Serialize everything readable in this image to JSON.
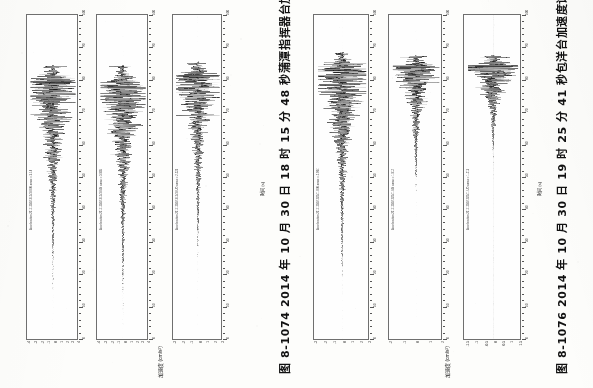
{
  "page": {
    "background_color": "#fdfdfb",
    "orientation": "rotated-90"
  },
  "figures": [
    {
      "id": "figure-left",
      "caption": "图 8-1074  2014 年 10 月 30 日 18 时 15 分 48 秒蒲潭指挥器台加速度记录",
      "axis_title": "加速度 (cm/s²)",
      "time_label": "时间 (s)",
      "panels": [
        {
          "name": "panel-ew",
          "trace_label": "Acceleration 20141030/181548 EW  amax = 3.48",
          "axis_ticks": [
            "0",
            "10",
            "20",
            "30",
            "40",
            "50",
            "60",
            "70",
            "80",
            "90",
            "100"
          ],
          "amp_ticks": [
            "-4",
            "-3",
            "-2",
            "-1",
            "0",
            "1",
            "2",
            "3",
            "4"
          ]
        },
        {
          "name": "panel-ns",
          "trace_label": "Acceleration 20141030/181548 NS  amax = 3.905",
          "axis_ticks": [
            "0",
            "10",
            "20",
            "30",
            "40",
            "50",
            "60",
            "70",
            "80",
            "90",
            "100"
          ],
          "amp_ticks": [
            "-4",
            "-3",
            "-2",
            "-1",
            "0",
            "1",
            "2",
            "3",
            "4"
          ]
        },
        {
          "name": "panel-ud",
          "trace_label": "Acceleration 20141030/181548 UD  amax = 2.225",
          "axis_ticks": [
            "0",
            "10",
            "20",
            "30",
            "40",
            "50",
            "60",
            "70",
            "80",
            "90",
            "100"
          ],
          "amp_ticks": [
            "-3",
            "-2",
            "-1",
            "0",
            "1",
            "2",
            "3"
          ]
        }
      ]
    },
    {
      "id": "figure-right",
      "caption": "图 8-1076  2014 年 10 月 30 日 19 时 25 分 41 秒包洋台加速度记录",
      "axis_title": "加速度 (cm/s²)",
      "time_label": "时间 (s)",
      "panels": [
        {
          "name": "panel-ew",
          "trace_label": "Acceleration 20141030/192541 EW  amax = 2.964",
          "axis_ticks": [
            "0",
            "10",
            "20",
            "30",
            "40",
            "50",
            "60",
            "70",
            "80",
            "90",
            "100"
          ],
          "amp_ticks": [
            "-3",
            "-2",
            "-1",
            "0",
            "1",
            "2",
            "3"
          ]
        },
        {
          "name": "panel-ns",
          "trace_label": "Acceleration 20141030/192541 NS  amax = 1.912",
          "axis_ticks": [
            "0",
            "10",
            "20",
            "30",
            "40",
            "50",
            "60",
            "70",
            "80",
            "90",
            "100"
          ],
          "amp_ticks": [
            "-2",
            "-1",
            "0",
            "1",
            "2"
          ]
        },
        {
          "name": "panel-ud",
          "trace_label": "Acceleration 20141030/192541 UD  amax = 1.213",
          "axis_ticks": [
            "0",
            "10",
            "20",
            "30",
            "40",
            "50",
            "60",
            "70",
            "80",
            "90",
            "100"
          ],
          "amp_ticks": [
            "-1.5",
            "-1",
            "-0.5",
            "0",
            "0.5",
            "1",
            "1.5"
          ]
        }
      ]
    }
  ],
  "chart_data": {
    "type": "line",
    "xlabel": "时间 (s)",
    "ylabel": "加速度 (cm/s²)",
    "xlim": [
      0,
      100
    ],
    "grid": false,
    "legend": "none",
    "note": "Six seismic acceleration traces, rotated 90 degrees on a scanned book page. Each trace is a zero-mean waveform with an impulsive P-onset, an S-wave peak and an exponentially decaying coda.",
    "series": [
      {
        "name": "20141030/181548 EW",
        "figure": "图 8-1074",
        "amax": 3.48,
        "units": "cm/s^2",
        "ylim": [
          -3.48,
          3.48
        ],
        "onset_s": 16,
        "peak_s": 21,
        "coda_end_s": 62
      },
      {
        "name": "20141030/181548 NS",
        "figure": "图 8-1074",
        "amax": 3.905,
        "units": "cm/s^2",
        "ylim": [
          -3.905,
          3.905
        ],
        "onset_s": 16,
        "peak_s": 22,
        "coda_end_s": 64
      },
      {
        "name": "20141030/181548 UD",
        "figure": "图 8-1074",
        "amax": 2.225,
        "units": "cm/s^2",
        "ylim": [
          -2.225,
          2.225
        ],
        "onset_s": 15,
        "peak_s": 19,
        "coda_end_s": 55
      },
      {
        "name": "20141030/192541 EW",
        "figure": "图 8-1076",
        "amax": 2.964,
        "units": "cm/s^2",
        "ylim": [
          -2.964,
          2.964
        ],
        "onset_s": 12,
        "peak_s": 17,
        "coda_end_s": 58
      },
      {
        "name": "20141030/192541 NS",
        "figure": "图 8-1076",
        "amax": 1.912,
        "units": "cm/s^2",
        "ylim": [
          -1.912,
          1.912
        ],
        "onset_s": 13,
        "peak_s": 16,
        "coda_end_s": 40
      },
      {
        "name": "20141030/192541 UD",
        "figure": "图 8-1076",
        "amax": 1.213,
        "units": "cm/s^2",
        "ylim": [
          -1.213,
          1.213
        ],
        "onset_s": 13,
        "peak_s": 16,
        "coda_end_s": 34
      }
    ]
  }
}
